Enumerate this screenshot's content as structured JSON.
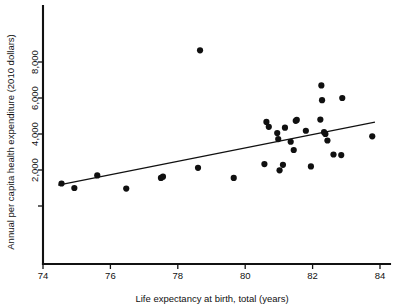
{
  "chart_data": {
    "type": "scatter",
    "title": "",
    "xlabel": "Life expectancy at birth, total (years)",
    "ylabel": "Annual per capita health expenditure (2010 dollars)",
    "xlim": [
      73.6,
      84.4
    ],
    "ylim": [
      0,
      9100
    ],
    "grid": false,
    "legend": null,
    "xticks": [
      74,
      76,
      78,
      80,
      82,
      84
    ],
    "xtick_labels": [
      "74",
      "76",
      "78",
      "80",
      "82",
      "84"
    ],
    "yticks": [
      2000,
      4000,
      6000,
      8000
    ],
    "ytick_labels": [
      "2,000",
      "4,000",
      "6,000",
      "8,000"
    ],
    "point_color": "#101010",
    "line_color": "#111111",
    "axis_color": "#111111",
    "points": [
      {
        "x": 74.55,
        "y": 1250
      },
      {
        "x": 74.93,
        "y": 1000
      },
      {
        "x": 75.61,
        "y": 1700
      },
      {
        "x": 76.47,
        "y": 970
      },
      {
        "x": 77.5,
        "y": 1560
      },
      {
        "x": 77.56,
        "y": 1630
      },
      {
        "x": 78.66,
        "y": 8650
      },
      {
        "x": 78.6,
        "y": 2120
      },
      {
        "x": 79.66,
        "y": 1560
      },
      {
        "x": 80.57,
        "y": 2330
      },
      {
        "x": 80.63,
        "y": 4670
      },
      {
        "x": 80.7,
        "y": 4400
      },
      {
        "x": 80.95,
        "y": 4050
      },
      {
        "x": 80.98,
        "y": 3720
      },
      {
        "x": 81.02,
        "y": 1980
      },
      {
        "x": 81.12,
        "y": 2290
      },
      {
        "x": 81.18,
        "y": 4350
      },
      {
        "x": 81.35,
        "y": 3570
      },
      {
        "x": 81.44,
        "y": 3110
      },
      {
        "x": 81.5,
        "y": 4730
      },
      {
        "x": 81.53,
        "y": 4780
      },
      {
        "x": 81.8,
        "y": 4180
      },
      {
        "x": 81.95,
        "y": 2200
      },
      {
        "x": 82.23,
        "y": 4800
      },
      {
        "x": 82.26,
        "y": 6700
      },
      {
        "x": 82.28,
        "y": 5880
      },
      {
        "x": 82.34,
        "y": 4100
      },
      {
        "x": 82.38,
        "y": 4000
      },
      {
        "x": 82.44,
        "y": 3640
      },
      {
        "x": 82.62,
        "y": 2860
      },
      {
        "x": 82.85,
        "y": 2830
      },
      {
        "x": 82.88,
        "y": 6000
      },
      {
        "x": 83.77,
        "y": 3870
      }
    ],
    "trend_line": {
      "x_start": 74.45,
      "y_start": 1160,
      "x_end": 83.85,
      "y_end": 4660
    }
  }
}
